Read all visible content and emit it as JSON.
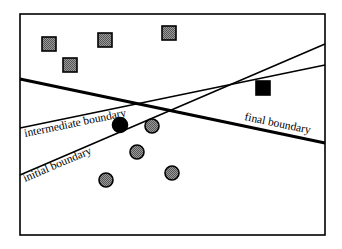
{
  "diagram": {
    "frame": {
      "x": 20,
      "y": 14,
      "width": 305,
      "height": 221
    },
    "colors": {
      "stroke": "#000000",
      "gray_fill": "#777777",
      "black_fill": "#000000",
      "background": "#ffffff"
    },
    "boundaries": [
      {
        "id": "final",
        "label": "final boundary",
        "x1": 20,
        "y1": 79,
        "x2": 325,
        "y2": 143,
        "stroke_width": 3.2,
        "label_x": 244,
        "label_y": 120,
        "label_angle": 11.8
      },
      {
        "id": "intermediate",
        "label": "intermediate boundary",
        "x1": 20,
        "y1": 128,
        "x2": 325,
        "y2": 65,
        "stroke_width": 1.6,
        "label_x": 25,
        "label_y": 137,
        "label_angle": -11.6
      },
      {
        "id": "initial",
        "label": "initial boundary",
        "x1": 20,
        "y1": 175,
        "x2": 325,
        "y2": 44,
        "stroke_width": 1.6,
        "label_x": 25,
        "label_y": 182,
        "label_angle": -23.2
      }
    ],
    "squares": [
      {
        "cx": 49,
        "cy": 44,
        "size": 14,
        "fill": "gray"
      },
      {
        "cx": 105,
        "cy": 40,
        "size": 14,
        "fill": "gray"
      },
      {
        "cx": 169,
        "cy": 33,
        "size": 14,
        "fill": "gray"
      },
      {
        "cx": 70,
        "cy": 65,
        "size": 14,
        "fill": "gray"
      },
      {
        "cx": 263,
        "cy": 88,
        "size": 14,
        "fill": "black"
      }
    ],
    "circles": [
      {
        "cx": 120,
        "cy": 125,
        "r": 7.5,
        "fill": "black"
      },
      {
        "cx": 152,
        "cy": 126,
        "r": 7,
        "fill": "gray"
      },
      {
        "cx": 137,
        "cy": 152,
        "r": 7,
        "fill": "gray"
      },
      {
        "cx": 106,
        "cy": 180,
        "r": 7,
        "fill": "gray"
      },
      {
        "cx": 172,
        "cy": 173,
        "r": 7,
        "fill": "gray"
      }
    ]
  }
}
